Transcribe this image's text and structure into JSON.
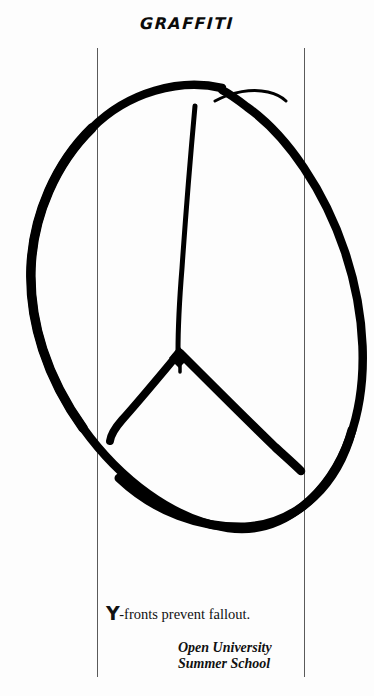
{
  "page": {
    "title": "GRAFFITI",
    "background_color": "#fdfdfd",
    "ink_color": "#000000",
    "rule_color": "#5a5a5a"
  },
  "artwork": {
    "name": "peace-symbol-graffiti-drawing",
    "description": "Hand-drawn peace symbol in thick black marker strokes",
    "style": "brush-marker",
    "stroke_color": "#000000"
  },
  "caption": {
    "dropcap": "Y",
    "text": "-fronts prevent fallout."
  },
  "attribution": {
    "line1": "Open University",
    "line2": "Summer School"
  }
}
